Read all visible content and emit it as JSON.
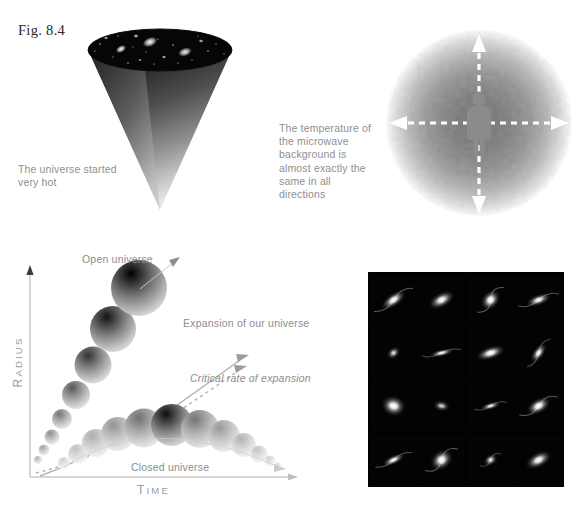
{
  "figure": {
    "label": "Fig. 8.4"
  },
  "panels": {
    "cone": {
      "name": "expanding-universe-cone",
      "caption": "The universe started very hot",
      "top_fill": "#060608",
      "body_gradient_from": "#1c1c1e",
      "body_gradient_to": "#d8d8d8",
      "galaxies": [
        {
          "cx": 33,
          "cy": 19,
          "rx": 5.5,
          "ry": 3.4,
          "rot": -28,
          "b": 1.0
        },
        {
          "cx": 62,
          "cy": 12,
          "rx": 7.5,
          "ry": 4.6,
          "rot": -22,
          "b": 1.0
        },
        {
          "cx": 97,
          "cy": 22,
          "rx": 7.0,
          "ry": 4.2,
          "rot": -18,
          "b": 0.95
        },
        {
          "cx": 18,
          "cy": 8,
          "rx": 2.2,
          "ry": 1.6,
          "rot": 0,
          "b": 0.8
        },
        {
          "cx": 48,
          "cy": 6,
          "rx": 2.6,
          "ry": 1.9,
          "rot": 0,
          "b": 0.85
        },
        {
          "cx": 113,
          "cy": 11,
          "rx": 2.4,
          "ry": 1.8,
          "rot": 0,
          "b": 0.8
        },
        {
          "cx": 76,
          "cy": 27,
          "rx": 2.2,
          "ry": 1.7,
          "rot": 0,
          "b": 0.8
        },
        {
          "cx": 52,
          "cy": 30,
          "rx": 1.8,
          "ry": 1.4,
          "rot": 0,
          "b": 0.7
        }
      ],
      "stars": [
        {
          "cx": 12,
          "cy": 14,
          "r": 0.7
        },
        {
          "cx": 25,
          "cy": 27,
          "r": 0.6
        },
        {
          "cx": 40,
          "cy": 33,
          "r": 0.7
        },
        {
          "cx": 58,
          "cy": 22,
          "r": 0.6
        },
        {
          "cx": 70,
          "cy": 9,
          "r": 0.6
        },
        {
          "cx": 85,
          "cy": 15,
          "r": 0.7
        },
        {
          "cx": 90,
          "cy": 33,
          "r": 0.6
        },
        {
          "cx": 104,
          "cy": 30,
          "r": 0.6
        },
        {
          "cx": 120,
          "cy": 21,
          "r": 0.7
        },
        {
          "cx": 128,
          "cy": 14,
          "r": 0.6
        },
        {
          "cx": 30,
          "cy": 6,
          "r": 0.6
        },
        {
          "cx": 7,
          "cy": 21,
          "r": 0.6
        },
        {
          "cx": 66,
          "cy": 34,
          "r": 0.6
        },
        {
          "cx": 110,
          "cy": 6,
          "r": 0.5
        },
        {
          "cx": 136,
          "cy": 24,
          "r": 0.6
        },
        {
          "cx": 45,
          "cy": 17,
          "r": 0.5
        }
      ]
    },
    "cmb": {
      "name": "microwave-background-sphere",
      "caption": "The temperature of the microwave background is almost exactly the same in all directions",
      "sphere_center_color": "#7d7d7d",
      "sphere_edge_color": "#ffffff",
      "person_color": "#8a8a8a",
      "arrow_color": "#ffffff",
      "arrow_directions": [
        "up",
        "down",
        "left",
        "right"
      ]
    },
    "graph": {
      "name": "radius-vs-time-graph",
      "axes": {
        "y_label": "RADIUS",
        "x_label": "TIME",
        "axis_color": "#bdbdbd"
      },
      "labels": {
        "open": "Open universe",
        "closed": "Closed universe",
        "expansion": "Expansion of our universe",
        "critical": "Critical rate of expansion"
      },
      "open_universe_spheres": [
        {
          "cx": 38,
          "cy": 215,
          "r": 4,
          "dark": 0.3
        },
        {
          "cx": 44,
          "cy": 205,
          "r": 5.5,
          "dark": 0.36
        },
        {
          "cx": 52,
          "cy": 192,
          "r": 7.5,
          "dark": 0.44
        },
        {
          "cx": 62,
          "cy": 174,
          "r": 10,
          "dark": 0.54
        },
        {
          "cx": 76,
          "cy": 150,
          "r": 14,
          "dark": 0.66
        },
        {
          "cx": 93,
          "cy": 120,
          "r": 18.5,
          "dark": 0.8
        },
        {
          "cx": 113,
          "cy": 84,
          "r": 23,
          "dark": 0.92
        },
        {
          "cx": 139,
          "cy": 43,
          "r": 28,
          "dark": 1.0
        }
      ],
      "closed_universe_spheres": [
        {
          "cx": 64,
          "cy": 218,
          "r": 6,
          "dark": 0.18
        },
        {
          "cx": 78,
          "cy": 209,
          "r": 10,
          "dark": 0.24
        },
        {
          "cx": 96,
          "cy": 198,
          "r": 14,
          "dark": 0.32
        },
        {
          "cx": 118,
          "cy": 189,
          "r": 17,
          "dark": 0.42
        },
        {
          "cx": 144,
          "cy": 183,
          "r": 19.5,
          "dark": 0.56
        },
        {
          "cx": 172,
          "cy": 180,
          "r": 21,
          "dark": 0.95
        },
        {
          "cx": 200,
          "cy": 184,
          "r": 19,
          "dark": 0.54
        },
        {
          "cx": 224,
          "cy": 191,
          "r": 16,
          "dark": 0.4
        },
        {
          "cx": 244,
          "cy": 200,
          "r": 12,
          "dark": 0.3
        },
        {
          "cx": 259,
          "cy": 209,
          "r": 8.5,
          "dark": 0.23
        },
        {
          "cx": 270,
          "cy": 216,
          "r": 5.5,
          "dark": 0.18
        },
        {
          "cx": 278,
          "cy": 221,
          "r": 3.5,
          "dark": 0.14
        }
      ]
    },
    "galaxy_grid": {
      "name": "galaxy-photo-grid",
      "rows": 4,
      "columns": 4,
      "background": "#000000",
      "cells": [
        {
          "rx": 15,
          "ry": 7,
          "rot": -35,
          "spiral": true,
          "bright": 1.0
        },
        {
          "rx": 15,
          "ry": 8,
          "rot": -28,
          "spiral": false,
          "bright": 0.95
        },
        {
          "rx": 12,
          "ry": 9,
          "rot": -50,
          "spiral": true,
          "bright": 1.0
        },
        {
          "rx": 14,
          "ry": 6,
          "rot": -20,
          "spiral": true,
          "bright": 0.9
        },
        {
          "rx": 8,
          "ry": 6,
          "rot": -40,
          "spiral": false,
          "bright": 0.7
        },
        {
          "rx": 13,
          "ry": 4,
          "rot": -12,
          "spiral": true,
          "bright": 0.85
        },
        {
          "rx": 16,
          "ry": 7,
          "rot": -18,
          "spiral": false,
          "bright": 1.0
        },
        {
          "rx": 12,
          "ry": 6,
          "rot": -55,
          "spiral": true,
          "bright": 0.9
        },
        {
          "rx": 11,
          "ry": 13,
          "rot": -75,
          "spiral": false,
          "bright": 1.0
        },
        {
          "rx": 6,
          "ry": 9,
          "rot": -80,
          "spiral": false,
          "bright": 0.65
        },
        {
          "rx": 11,
          "ry": 4,
          "rot": -15,
          "spiral": true,
          "bright": 0.8
        },
        {
          "rx": 14,
          "ry": 8,
          "rot": -30,
          "spiral": true,
          "bright": 1.0
        },
        {
          "rx": 13,
          "ry": 5,
          "rot": -25,
          "spiral": true,
          "bright": 0.9
        },
        {
          "rx": 13,
          "ry": 10,
          "rot": -40,
          "spiral": true,
          "bright": 1.0
        },
        {
          "rx": 8,
          "ry": 6,
          "rot": -35,
          "spiral": true,
          "bright": 0.75
        },
        {
          "rx": 15,
          "ry": 8,
          "rot": -28,
          "spiral": false,
          "bright": 0.95
        }
      ]
    }
  }
}
